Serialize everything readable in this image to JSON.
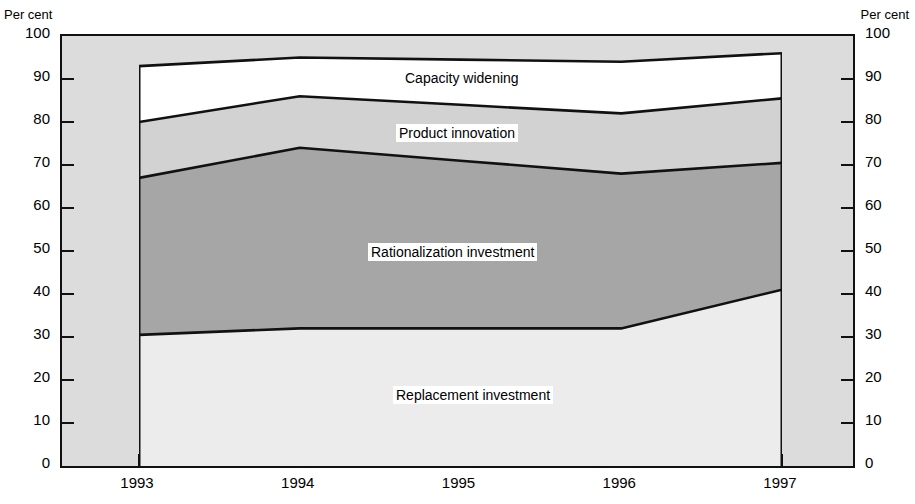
{
  "axis_unit_left": "Per cent",
  "axis_unit_right": "Per cent",
  "chart_data": {
    "type": "area",
    "title": "",
    "subtitle": "",
    "xlabel": "",
    "ylabel": "Per cent",
    "ylabel_right": "Per cent",
    "ylim": [
      0,
      100
    ],
    "ytick_values": [
      0,
      10,
      20,
      30,
      40,
      50,
      60,
      70,
      80,
      90,
      100
    ],
    "ytick_labels": [
      "0",
      "10",
      "20",
      "30",
      "40",
      "50",
      "60",
      "70",
      "80",
      "90",
      "100"
    ],
    "ytick_labels_right": [
      "0",
      "10",
      "20",
      "30",
      "40",
      "50",
      "60",
      "70",
      "80",
      "90",
      "100"
    ],
    "grid": false,
    "stacked": true,
    "legend_position": "inside-bands",
    "x": [
      1993,
      1994,
      1995,
      1996,
      1997
    ],
    "categories": [
      "1993",
      "1994",
      "1995",
      "1996",
      "1997"
    ],
    "series": [
      {
        "name": "Replacement investment",
        "color": "#ececec",
        "values": [
          30.5,
          32.0,
          32.0,
          32.0,
          41.0
        ],
        "cumulative_top": [
          30.5,
          32.0,
          32.0,
          32.0,
          41.0
        ]
      },
      {
        "name": "Rationalization investment",
        "color": "#a6a6a6",
        "values": [
          36.5,
          42.0,
          39.0,
          36.0,
          29.5
        ],
        "cumulative_top": [
          67.0,
          74.0,
          71.0,
          68.0,
          70.5
        ]
      },
      {
        "name": "Product innovation",
        "color": "#d2d2d2",
        "values": [
          13.0,
          12.0,
          13.0,
          14.0,
          15.0
        ],
        "cumulative_top": [
          80.0,
          86.0,
          84.0,
          82.0,
          85.5
        ]
      },
      {
        "name": "Capacity widening",
        "color": "#ffffff",
        "values": [
          13.0,
          9.0,
          10.5,
          12.0,
          10.5
        ],
        "cumulative_top": [
          93.0,
          95.0,
          94.5,
          94.0,
          96.0
        ]
      }
    ],
    "band_labels": [
      "Capacity widening",
      "Product innovation",
      "Rationalization investment",
      "Replacement investment"
    ],
    "background_color": "#dcdcdc",
    "outline_color": "#111111"
  }
}
